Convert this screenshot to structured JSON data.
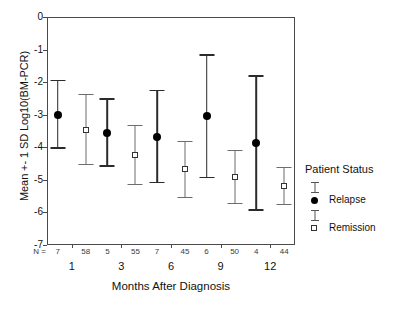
{
  "chart_data": {
    "type": "scatter",
    "title": "",
    "xlabel": "Months After Diagnosis",
    "ylabel": "Mean +- 1 SD Log10(BM-PCR)",
    "xlim": [
      0,
      6
    ],
    "ylim": [
      -7,
      0
    ],
    "yticks": [
      "0",
      "-1",
      "-2",
      "-3",
      "-4",
      "-5",
      "-6",
      "-7"
    ],
    "ytick_values": [
      0,
      -1,
      -2,
      -3,
      -4,
      -5,
      -6,
      -7
    ],
    "categories": [
      "1",
      "3",
      "6",
      "9",
      "12"
    ],
    "grid": false,
    "legend_position": "right",
    "n_label": "N =",
    "series": [
      {
        "name": "Relapse",
        "marker": "filled-circle",
        "n": [
          7,
          5,
          7,
          6,
          4
        ],
        "values": [
          -3.0,
          -3.55,
          -3.68,
          -3.05,
          -3.87
        ],
        "upper": [
          -1.92,
          -2.5,
          -2.23,
          -1.15,
          -1.78
        ],
        "lower": [
          -4.05,
          -4.6,
          -5.1,
          -4.95,
          -5.95
        ]
      },
      {
        "name": "Remission",
        "marker": "open-square",
        "n": [
          58,
          55,
          45,
          50,
          44
        ],
        "values": [
          -3.47,
          -4.25,
          -4.68,
          -4.92,
          -5.2
        ],
        "upper": [
          -2.37,
          -3.32,
          -3.8,
          -4.08,
          -4.6
        ],
        "lower": [
          -4.55,
          -5.17,
          -5.56,
          -5.75,
          -5.78
        ]
      }
    ]
  },
  "legend": {
    "title": "Patient Status",
    "entries": [
      {
        "label": "Relapse"
      },
      {
        "label": "Remission"
      }
    ]
  }
}
